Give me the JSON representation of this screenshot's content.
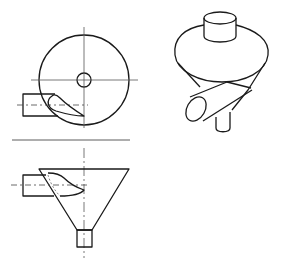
{
  "diagram": {
    "views": [
      {
        "id": "top-view",
        "label": "Top view (plan)",
        "description": "Circular body with central outlet and tangential inlet"
      },
      {
        "id": "front-view",
        "label": "Front view (elevation)",
        "description": "Conical funnel body with tangential inlet and bottom outlet"
      },
      {
        "id": "isometric-view",
        "label": "Isometric view",
        "description": "3D sketch with top cylinder, cone body, side inlet and bottom outlet"
      }
    ],
    "colors": {
      "line": "#1a1a1a",
      "background": "#ffffff"
    }
  }
}
